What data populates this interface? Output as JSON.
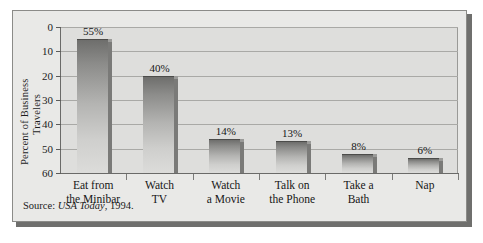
{
  "figure": {
    "source_prefix": "Source:",
    "source_italic": "USA Today",
    "source_suffix": ", 1994."
  },
  "axis": {
    "y_title_line1": "Percent of Business",
    "y_title_line2": "Travelers",
    "y_ticks": [
      "60",
      "50",
      "40",
      "30",
      "20",
      "10",
      "0"
    ]
  },
  "chart_data": {
    "type": "bar",
    "title": "",
    "subtitle": "",
    "xlabel": "",
    "ylabel": "Percent of Business Travelers",
    "ylim": [
      0,
      60
    ],
    "ytick_values": [
      0,
      10,
      20,
      30,
      40,
      50,
      60
    ],
    "grid": true,
    "legend": "none",
    "orientation": "vertical",
    "bar_style": "3d-shaded-gray-gradient",
    "categories": [
      "Eat from the Minibar",
      "Watch TV",
      "Watch a Movie",
      "Talk on the Phone",
      "Take a Bath",
      "Nap"
    ],
    "category_lines": [
      [
        "Eat from",
        "the Minibar"
      ],
      [
        "Watch",
        "TV"
      ],
      [
        "Watch",
        "a Movie"
      ],
      [
        "Talk on",
        "the Phone"
      ],
      [
        "Take a",
        "Bath"
      ],
      [
        "Nap",
        ""
      ]
    ],
    "values": [
      55,
      40,
      14,
      13,
      8,
      6
    ],
    "data_labels": [
      "55%",
      "40%",
      "14%",
      "13%",
      "8%",
      "6%"
    ],
    "annotations": [
      "Source: USA Today, 1994."
    ]
  },
  "colors": {
    "page_background": "#ffffff",
    "figure_background": "#e9e9e7",
    "plot_background": "#dededc",
    "frame_border": "#8b8b88",
    "shadow": "#6f6f6d",
    "gridline": "#a9a9a6",
    "axis_line": "#6a6a68",
    "bar_top": "#6e6e6c",
    "bar_bottom": "#dcdcda",
    "bar_side": "#7a7a78",
    "text": "#161616"
  }
}
